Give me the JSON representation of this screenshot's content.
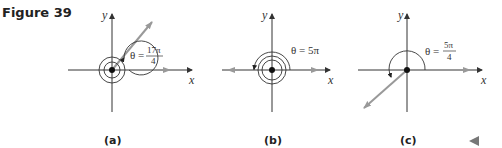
{
  "figure": {
    "title": "Figure 39",
    "panels": [
      {
        "id": "a",
        "caption": "(a)",
        "angle_label": "θ =",
        "angle_num": "17π",
        "angle_den": "4",
        "x_label": "x",
        "y_label": "y"
      },
      {
        "id": "b",
        "caption": "(b)",
        "angle_label": "θ = 5π",
        "x_label": "x",
        "y_label": "y"
      },
      {
        "id": "c",
        "caption": "(c)",
        "angle_label": "θ =",
        "angle_num": "5π",
        "angle_den": "4",
        "x_label": "x",
        "y_label": "y"
      }
    ],
    "nav_icon": "back-triangle-icon",
    "colors": {
      "axis": "#333333",
      "ray": "#9a9a9a",
      "text": "#222222"
    }
  }
}
